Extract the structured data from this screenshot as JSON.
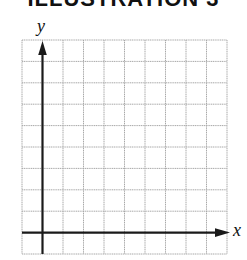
{
  "title": "ILLUSTRATION 3",
  "axes": {
    "x_label": "x",
    "y_label": "y"
  },
  "grid": {
    "columns": 10,
    "rows": 10,
    "line_color": "#a8a8a8",
    "axis_color": "#1a1a1a"
  }
}
